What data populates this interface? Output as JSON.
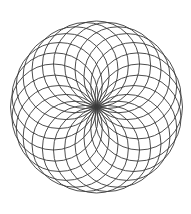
{
  "diagram": {
    "type": "circle-rosette",
    "center": [
      96.5,
      107
    ],
    "circle_count": 24,
    "circle_radius": 43,
    "stroke_color": "#3a3a3a",
    "background_color": "#ffffff",
    "stroke_width": 0.9
  }
}
